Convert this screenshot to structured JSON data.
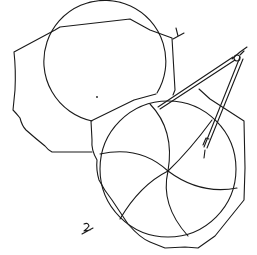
{
  "figure": {
    "type": "hand-drawn sketch",
    "labels": [
      {
        "id": "board-1",
        "text": "1"
      },
      {
        "id": "board-2",
        "text": "2"
      }
    ],
    "colors": {
      "ink": "#1a1a1a",
      "background": "#ffffff"
    },
    "parts": [
      "board 1 with circle",
      "board 2 with circle divided by six arcs",
      "drafting compass"
    ]
  }
}
